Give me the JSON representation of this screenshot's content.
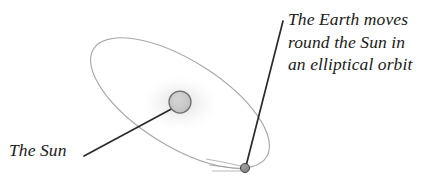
{
  "figure": {
    "type": "diagram",
    "background_color": "#ffffff",
    "width": 431,
    "height": 185
  },
  "labels": {
    "earth": {
      "name": "earth-orbit-caption",
      "lines": [
        "The Earth moves",
        "round the Sun in",
        "an elliptical orbit"
      ],
      "line1": "The Earth moves",
      "line2": "round the Sun in",
      "line3": "an elliptical orbit",
      "style": "italic-serif",
      "color": "#1a1a1a"
    },
    "sun": {
      "name": "sun-caption",
      "text": "The Sun",
      "style": "italic-serif",
      "color": "#1a1a1a"
    }
  },
  "shapes": {
    "orbit_ellipse": {
      "name": "elliptical-orbit",
      "center_x": 180,
      "center_y": 103,
      "radius_major": 102,
      "radius_minor": 43,
      "rotation_deg": 32,
      "stroke_color": "#a9a7ab",
      "stroke_width": 1.1,
      "fill": "none"
    },
    "sun_body": {
      "name": "sun-circle",
      "center_x": 180,
      "center_y": 102,
      "radius": 11,
      "fill_color": "#c9c9c9",
      "stroke_color": "#6e6e6e",
      "stroke_width": 1.2,
      "glow_color": "#d8d8d8"
    },
    "earth_body": {
      "name": "earth-dot",
      "center_x": 245,
      "center_y": 168,
      "radius": 4.5,
      "fill_color": "#8e8e8e",
      "stroke_color": "#4a4a4a",
      "stroke_width": 1.0
    },
    "earth_leader_line": {
      "name": "earth-leader-line",
      "x1": 283,
      "y1": 21,
      "x2": 246,
      "y2": 166,
      "stroke_color": "#2a2a2a",
      "stroke_width": 1.6
    },
    "sun_leader_line": {
      "name": "sun-leader-line",
      "x1": 84,
      "y1": 156,
      "x2": 177,
      "y2": 106,
      "stroke_color": "#2a2a2a",
      "stroke_width": 1.6
    },
    "motion_trails": {
      "name": "earth-motion-trails",
      "count": 3,
      "stroke_color": "#9b9b9b",
      "stroke_width": 0.9
    }
  }
}
